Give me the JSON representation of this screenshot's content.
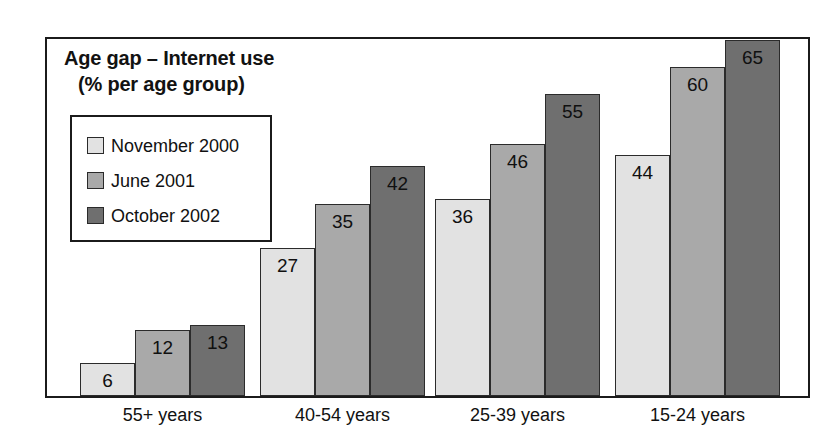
{
  "chart_data": {
    "type": "bar",
    "title": "Age gap – Internet use",
    "subtitle": "(% per age group)",
    "title_line_1": "Age gap – Internet use",
    "title_line_2": "(% per age group)",
    "xlabel": "",
    "ylabel": "",
    "ylim": [
      0,
      70
    ],
    "grid": false,
    "legend_position": "top-left",
    "categories": [
      "55+ years",
      "40-54 years",
      "25-39 years",
      "15-24 years"
    ],
    "series": [
      {
        "name": "November 2000",
        "color": "#e2e2e2",
        "values": [
          6,
          27,
          36,
          44
        ]
      },
      {
        "name": "June 2001",
        "color": "#a9a9a9",
        "values": [
          12,
          35,
          46,
          60
        ]
      },
      {
        "name": "October 2002",
        "color": "#6f6f6f",
        "values": [
          13,
          42,
          55,
          65
        ]
      }
    ]
  },
  "colors": {
    "frame": "#1b1b1b",
    "background": "#ffffff",
    "text": "#111111",
    "series_light": "#e2e2e2",
    "series_medium": "#a9a9a9",
    "series_dark": "#6f6f6f"
  }
}
